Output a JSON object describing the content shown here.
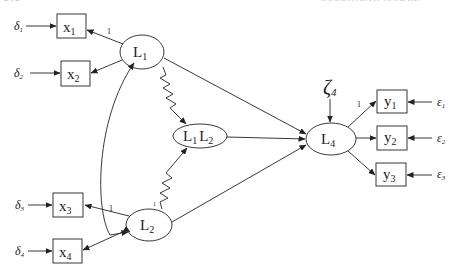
{
  "running_head": {
    "left": "212",
    "right": "COLLINEAR MODEL"
  },
  "diagram": {
    "type": "structural-equation-model",
    "colors": {
      "stroke": "#222222",
      "background": "#ffffff"
    },
    "observed": [
      {
        "id": "x1",
        "base": "x",
        "sub": "1"
      },
      {
        "id": "x2",
        "base": "x",
        "sub": "2"
      },
      {
        "id": "x3",
        "base": "x",
        "sub": "3"
      },
      {
        "id": "x4",
        "base": "x",
        "sub": "4"
      },
      {
        "id": "y1",
        "base": "y",
        "sub": "1"
      },
      {
        "id": "y2",
        "base": "y",
        "sub": "2"
      },
      {
        "id": "y3",
        "base": "y",
        "sub": "3"
      }
    ],
    "latent": [
      {
        "id": "L1",
        "base": "L",
        "sub": "1"
      },
      {
        "id": "L2",
        "base": "L",
        "sub": "2"
      },
      {
        "id": "L1L2",
        "base1": "L",
        "sub1": "1",
        "base2": "L",
        "sub2": "2"
      },
      {
        "id": "L4",
        "base": "L",
        "sub": "4"
      }
    ],
    "errors": [
      {
        "id": "delta1",
        "symbol": "δ",
        "sub": "1",
        "target": "x1"
      },
      {
        "id": "delta2",
        "symbol": "δ",
        "sub": "2",
        "target": "x2"
      },
      {
        "id": "delta3",
        "symbol": "δ",
        "sub": "3",
        "target": "x3"
      },
      {
        "id": "delta4",
        "symbol": "δ",
        "sub": "4",
        "target": "x4"
      },
      {
        "id": "eps1",
        "symbol": "ε",
        "sub": "1",
        "target": "y1"
      },
      {
        "id": "eps2",
        "symbol": "ε",
        "sub": "2",
        "target": "y2"
      },
      {
        "id": "eps3",
        "symbol": "ε",
        "sub": "3",
        "target": "y3"
      }
    ],
    "disturbance": {
      "id": "zeta4",
      "symbol": "ζ",
      "sub": "4",
      "target": "L4"
    },
    "fixed_loading_label": "1",
    "edges": [
      {
        "from": "L1",
        "to": "x1",
        "label": "1"
      },
      {
        "from": "L1",
        "to": "x2",
        "label": ""
      },
      {
        "from": "L2",
        "to": "x3",
        "label": "1"
      },
      {
        "from": "L2",
        "to": "x4",
        "label": ""
      },
      {
        "from": "L4",
        "to": "y1",
        "label": "1"
      },
      {
        "from": "L4",
        "to": "y2",
        "label": ""
      },
      {
        "from": "L4",
        "to": "y3",
        "label": ""
      },
      {
        "from": "L1",
        "to": "L4",
        "label": ""
      },
      {
        "from": "L1L2",
        "to": "L4",
        "label": ""
      },
      {
        "from": "L2",
        "to": "L4",
        "label": ""
      },
      {
        "from": "L1",
        "to": "L1L2",
        "label": "",
        "style": "zigzag"
      },
      {
        "from": "L2",
        "to": "L1L2",
        "label": "",
        "style": "zigzag"
      },
      {
        "from": "L1",
        "to": "L2",
        "label": "",
        "style": "covariance-curve"
      }
    ]
  }
}
